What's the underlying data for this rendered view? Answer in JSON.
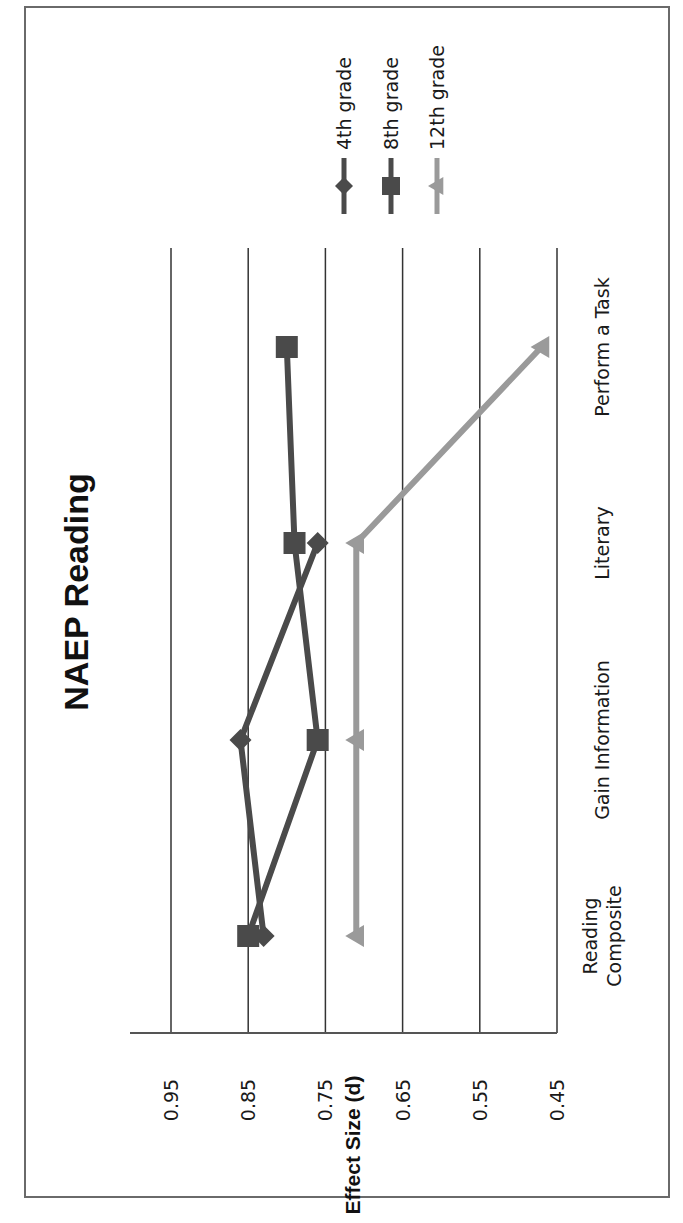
{
  "chart_data": {
    "type": "line",
    "title": "NAEP Reading",
    "xlabel": "",
    "ylabel": "Effect Size (d)",
    "categories": [
      "Reading Composite",
      "Gain Information",
      "Literary",
      "Perform a Task"
    ],
    "category_lines": [
      [
        "Reading",
        "Composite"
      ],
      [
        "Gain Information"
      ],
      [
        "Literary"
      ],
      [
        "Perform a Task"
      ]
    ],
    "ylim": [
      0.45,
      0.95
    ],
    "yticks": [
      "0.95",
      "0.85",
      "0.75",
      "0.65",
      "0.55",
      "0.45"
    ],
    "grid": true,
    "legend_position": "right",
    "orientation": "rotated 90 degrees clockwise on page",
    "series": [
      {
        "name": "4th grade",
        "marker": "diamond",
        "color": "#4a4a4a",
        "values": [
          0.83,
          0.86,
          0.76,
          null
        ]
      },
      {
        "name": "8th grade",
        "marker": "square",
        "color": "#4a4a4a",
        "values": [
          0.85,
          0.76,
          0.79,
          0.8
        ]
      },
      {
        "name": "12th grade",
        "marker": "triangle",
        "color": "#9a9a9a",
        "values": [
          0.71,
          0.71,
          0.71,
          0.47
        ]
      }
    ]
  }
}
